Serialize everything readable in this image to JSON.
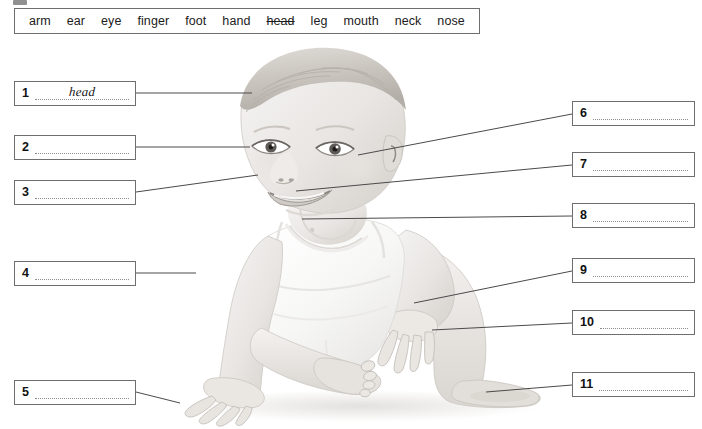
{
  "worksheet": {
    "type": "label-the-picture",
    "subject": "parts of the body",
    "image_subject": "baby-photograph-grayscale"
  },
  "wordbank": {
    "name": "word-bank",
    "words": [
      {
        "text": "arm",
        "used": false
      },
      {
        "text": "ear",
        "used": false
      },
      {
        "text": "eye",
        "used": false
      },
      {
        "text": "finger",
        "used": false
      },
      {
        "text": "foot",
        "used": false
      },
      {
        "text": "hand",
        "used": false
      },
      {
        "text": "head",
        "used": true
      },
      {
        "text": "leg",
        "used": false
      },
      {
        "text": "mouth",
        "used": false
      },
      {
        "text": "neck",
        "used": false
      },
      {
        "text": "nose",
        "used": false
      }
    ]
  },
  "answers": {
    "left": [
      {
        "number": "1",
        "value": "head",
        "target": "head"
      },
      {
        "number": "2",
        "value": "",
        "target": "eye"
      },
      {
        "number": "3",
        "value": "",
        "target": "nose"
      },
      {
        "number": "4",
        "value": "",
        "target": "arm"
      },
      {
        "number": "5",
        "value": "",
        "target": "hand"
      }
    ],
    "right": [
      {
        "number": "6",
        "value": "",
        "target": "ear"
      },
      {
        "number": "7",
        "value": "",
        "target": "mouth"
      },
      {
        "number": "8",
        "value": "",
        "target": "neck"
      },
      {
        "number": "9",
        "value": "",
        "target": "arm-wrist"
      },
      {
        "number": "10",
        "value": "",
        "target": "finger"
      },
      {
        "number": "11",
        "value": "",
        "target": "foot"
      }
    ]
  },
  "colors": {
    "border": "#6e6e6e",
    "text": "#1b1b1b",
    "dotted_line": "#8e8e8e",
    "connector": "#4a4a4a",
    "page_background": "#ffffff",
    "skin_light": "#f2f0ee",
    "skin_mid": "#dedad6",
    "hair": "#cfcbc6",
    "shirt": "#fbfbfb"
  }
}
